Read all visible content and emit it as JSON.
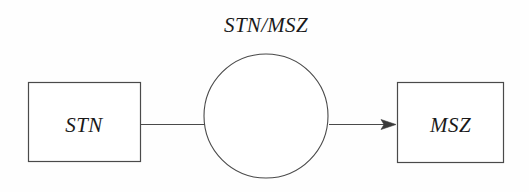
{
  "diagram": {
    "type": "entity-relationship-diagram",
    "background_color": "#fefefe",
    "stroke_color": "#3a3a3a",
    "text_color": "#1a1a1a",
    "relation": {
      "label": "STN/MSZ",
      "shape": "circle",
      "center_x": 266,
      "center_y": 116,
      "radius": 62
    },
    "entities": [
      {
        "name": "source-entity",
        "label": "STN",
        "shape": "rectangle",
        "x": 28,
        "y": 82,
        "width": 112,
        "height": 79
      },
      {
        "name": "target-entity",
        "label": "MSZ",
        "shape": "rectangle",
        "x": 397,
        "y": 82,
        "width": 107,
        "height": 81
      }
    ],
    "connectors": [
      {
        "name": "stn-to-relation",
        "from": "STN",
        "to": "STN/MSZ",
        "arrowhead": false,
        "x1": 140,
        "y1": 124,
        "x2": 204,
        "y2": 124
      },
      {
        "name": "relation-to-msz",
        "from": "STN/MSZ",
        "to": "MSZ",
        "arrowhead": true,
        "x1": 329,
        "y1": 124,
        "x2": 396,
        "y2": 124
      }
    ]
  }
}
